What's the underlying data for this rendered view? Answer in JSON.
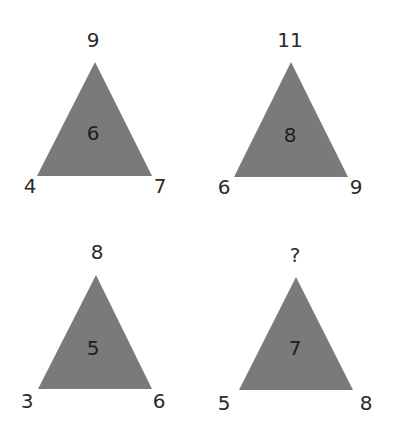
{
  "puzzle": {
    "triangle_color": "#7a7a7a",
    "text_color": "#2a2a2a",
    "triangles": [
      {
        "top": "9",
        "left": "4",
        "right": "7",
        "center": "6"
      },
      {
        "top": "11",
        "left": "6",
        "right": "9",
        "center": "8"
      },
      {
        "top": "8",
        "left": "3",
        "right": "6",
        "center": "5"
      },
      {
        "top": "?",
        "left": "5",
        "right": "8",
        "center": "7"
      }
    ]
  }
}
